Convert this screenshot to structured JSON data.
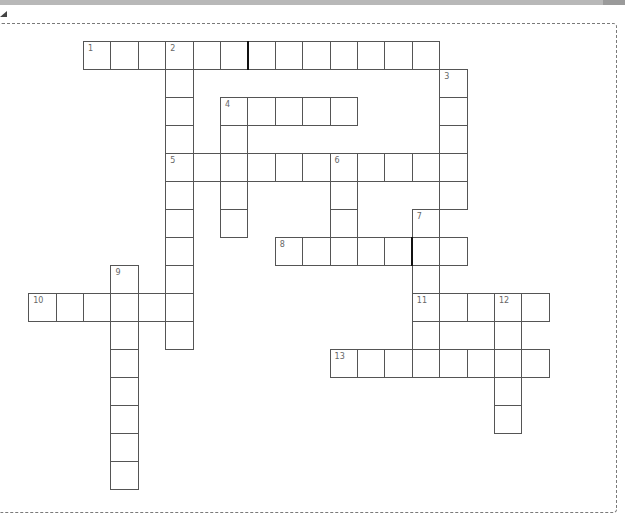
{
  "puzzle": {
    "type": "crossword",
    "grid_origin": {
      "x": 83,
      "y": 41
    },
    "cell_size": {
      "w": 27.4,
      "h": 28
    },
    "entries": [
      {
        "number": "1",
        "direction": "across",
        "row": 0,
        "col": 0,
        "length": 13
      },
      {
        "number": "2",
        "direction": "down",
        "row": 0,
        "col": 3,
        "length": 11
      },
      {
        "number": "3",
        "direction": "down",
        "row": 1,
        "col": 13,
        "length": 5
      },
      {
        "number": "4",
        "direction": "across",
        "row": 2,
        "col": 5,
        "length": 5
      },
      {
        "number": "4",
        "direction": "down",
        "row": 2,
        "col": 5,
        "length": 5
      },
      {
        "number": "5",
        "direction": "across",
        "row": 4,
        "col": 3,
        "length": 11
      },
      {
        "number": "6",
        "direction": "down",
        "row": 4,
        "col": 9,
        "length": 4
      },
      {
        "number": "7",
        "direction": "down",
        "row": 6,
        "col": 12,
        "length": 6
      },
      {
        "number": "8",
        "direction": "across",
        "row": 7,
        "col": 7,
        "length": 7
      },
      {
        "number": "9",
        "direction": "down",
        "row": 8,
        "col": 1,
        "length": 8
      },
      {
        "number": "10",
        "direction": "across",
        "row": 9,
        "col": -2,
        "length": 6
      },
      {
        "number": "11",
        "direction": "across",
        "row": 9,
        "col": 12,
        "length": 5
      },
      {
        "number": "12",
        "direction": "down",
        "row": 9,
        "col": 15,
        "length": 5
      },
      {
        "number": "13",
        "direction": "across",
        "row": 11,
        "col": 9,
        "length": 8
      }
    ],
    "thick_dividers": [
      {
        "row": 0,
        "after_col": 5
      },
      {
        "row": 7,
        "after_col": 11
      }
    ]
  },
  "labels": {
    "n1": "1",
    "n2": "2",
    "n3": "3",
    "n4": "4",
    "n5": "5",
    "n6": "6",
    "n7": "7",
    "n8": "8",
    "n9": "9",
    "n10": "10",
    "n11": "11",
    "n12": "12",
    "n13": "13"
  }
}
